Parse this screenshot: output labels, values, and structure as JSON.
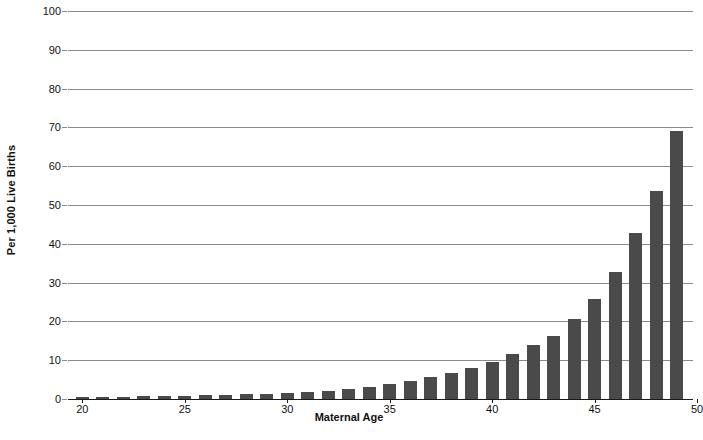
{
  "chart_data": {
    "type": "bar",
    "title": "",
    "xlabel": "Maternal Age",
    "ylabel": "Per 1,000 Live Births",
    "xlim": [
      19.3,
      49.8
    ],
    "ylim": [
      0,
      100
    ],
    "grid": true,
    "legend": null,
    "bar_color": "#4a4a4a",
    "gridline_color": "#8b8b8b",
    "axis_color": "#1a1a1a",
    "ytick_labels": [
      "0",
      "10",
      "20",
      "30",
      "40",
      "50",
      "60",
      "70",
      "80",
      "90",
      "100"
    ],
    "ytick_values": [
      0,
      10,
      20,
      30,
      40,
      50,
      60,
      70,
      80,
      90,
      100
    ],
    "xtick_labels": [
      "20",
      "25",
      "30",
      "35",
      "40",
      "45",
      "50"
    ],
    "xtick_values": [
      20,
      25,
      30,
      35,
      40,
      45,
      50
    ],
    "categories": [
      20,
      21,
      22,
      23,
      24,
      25,
      26,
      27,
      28,
      29,
      30,
      31,
      32,
      33,
      34,
      35,
      36,
      37,
      38,
      39,
      40,
      41,
      42,
      43,
      44,
      45,
      46,
      47,
      48,
      49
    ],
    "values": [
      0.6,
      0.6,
      0.6,
      0.7,
      0.8,
      0.9,
      1.0,
      1.1,
      1.2,
      1.3,
      1.5,
      1.8,
      2.1,
      2.6,
      3.2,
      3.9,
      4.7,
      5.6,
      6.7,
      8.0,
      9.6,
      11.5,
      13.8,
      16.2,
      20.5,
      25.9,
      32.8,
      42.8,
      53.5,
      69.2
    ],
    "values_last": 89.0,
    "annotations": []
  },
  "axes": {
    "y_title": "Per 1,000 Live Births",
    "x_title": "Maternal Age"
  },
  "caption": {
    "text": ""
  }
}
